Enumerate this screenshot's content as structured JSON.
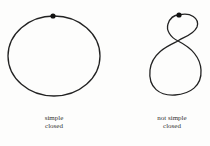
{
  "diagram": {
    "curves": [
      {
        "id": "simple-closed",
        "label_line1": "simple",
        "label_line2": "closed",
        "shape": "ellipse",
        "marked_point": "top"
      },
      {
        "id": "not-simple-closed",
        "label_line1": "not simple",
        "label_line2": "closed",
        "shape": "figure-eight",
        "marked_point": "top"
      }
    ],
    "colors": {
      "stroke": "#222222",
      "background": "#fdfdfc"
    }
  }
}
